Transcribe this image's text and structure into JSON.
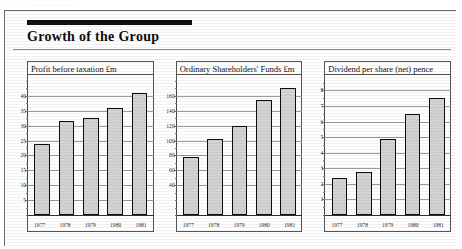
{
  "page": {
    "ghost_text": "..  ....  ..  ................ .",
    "heading": "Growth of the Group"
  },
  "chart_data": [
    {
      "type": "bar",
      "title": "Profit before taxation £m",
      "categories": [
        "1977",
        "1978",
        "1979",
        "1980",
        "1981"
      ],
      "values": [
        24,
        31.5,
        32.5,
        36,
        41
      ],
      "ticks": [
        40,
        35,
        30,
        25,
        20,
        15,
        10,
        5
      ],
      "ylim": [
        0,
        45
      ],
      "xlabel": "",
      "ylabel": "",
      "grid": true,
      "legend": "none"
    },
    {
      "type": "bar",
      "title": "Ordinary Shareholders' Funds £m",
      "categories": [
        "1977",
        "1978",
        "1979",
        "1980",
        "1981"
      ],
      "values": [
        78,
        102,
        120,
        155,
        170
      ],
      "ticks": [
        160,
        140,
        120,
        100,
        80,
        60,
        40
      ],
      "ylim": [
        0,
        180
      ],
      "xlabel": "",
      "ylabel": "",
      "grid": true,
      "legend": "none"
    },
    {
      "type": "bar",
      "title": "Dividend per share (net) pence",
      "categories": [
        "1977",
        "1978",
        "1979",
        "1980",
        "1981"
      ],
      "values": [
        2.4,
        2.75,
        4.9,
        6.5,
        7.5
      ],
      "ticks": [
        8,
        7,
        6,
        5,
        4,
        3,
        2,
        1
      ],
      "ylim": [
        0,
        8.6
      ],
      "xlabel": "",
      "ylabel": "",
      "grid": true,
      "legend": "none"
    }
  ]
}
